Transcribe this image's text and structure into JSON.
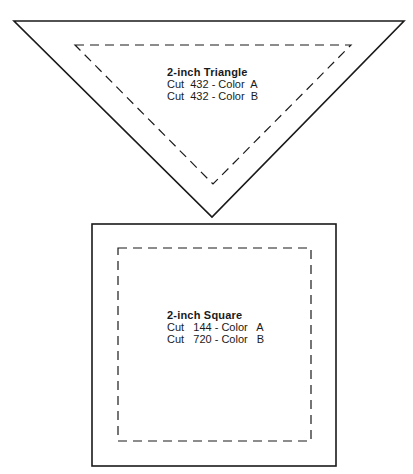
{
  "pattern_pieces": [
    {
      "shape": "triangle",
      "title": "2-inch Triangle",
      "lines": [
        "Cut  432 - Color  A",
        "Cut  432 - Color  B"
      ]
    },
    {
      "shape": "square",
      "title": "2-inch Square",
      "lines": [
        "Cut   144 - Color   A",
        "Cut   720 - Color   B"
      ]
    }
  ],
  "colors": {
    "stroke": "#1a1a1a",
    "background": "#ffffff"
  }
}
